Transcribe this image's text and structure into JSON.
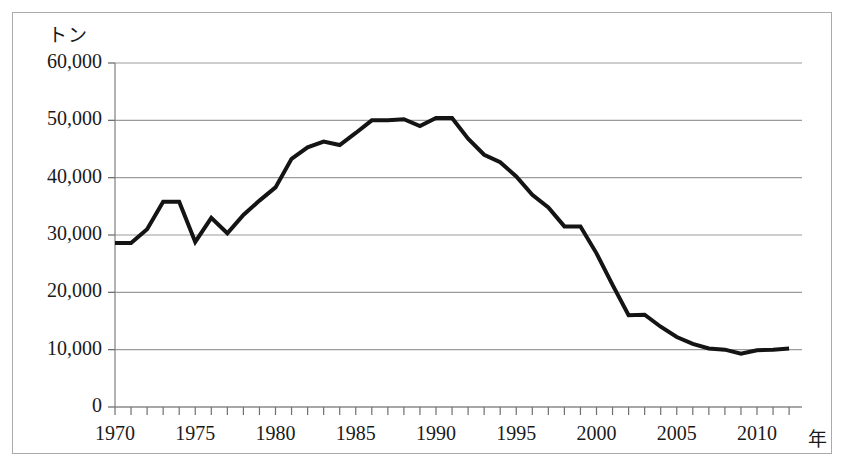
{
  "chart_data": {
    "type": "line",
    "title": "",
    "subtitle": "",
    "xlabel": "年",
    "ylabel": "トン",
    "ylim": [
      0,
      60000
    ],
    "xlim": [
      1970,
      2012
    ],
    "grid": true,
    "legend": false,
    "y_ticks": [
      {
        "value": 60000,
        "label": "60,000"
      },
      {
        "value": 50000,
        "label": "50,000"
      },
      {
        "value": 40000,
        "label": "40,000"
      },
      {
        "value": 30000,
        "label": "30,000"
      },
      {
        "value": 20000,
        "label": "20,000"
      },
      {
        "value": 10000,
        "label": "10,000"
      },
      {
        "value": 0,
        "label": "0"
      }
    ],
    "x_ticks_major": [
      {
        "value": 1970,
        "label": "1970"
      },
      {
        "value": 1975,
        "label": "1975"
      },
      {
        "value": 1980,
        "label": "1980"
      },
      {
        "value": 1985,
        "label": "1985"
      },
      {
        "value": 1990,
        "label": "1990"
      },
      {
        "value": 1995,
        "label": "1995"
      },
      {
        "value": 2000,
        "label": "2000"
      },
      {
        "value": 2005,
        "label": "2005"
      },
      {
        "value": 2010,
        "label": "2010"
      }
    ],
    "x_tick_interval_minor": 1,
    "series": [
      {
        "name": "",
        "color": "#141414",
        "line_width": 4,
        "x": [
          1970,
          1971,
          1972,
          1973,
          1974,
          1975,
          1976,
          1977,
          1978,
          1979,
          1980,
          1981,
          1982,
          1983,
          1984,
          1985,
          1986,
          1987,
          1988,
          1989,
          1990,
          1991,
          1992,
          1993,
          1994,
          1995,
          1996,
          1997,
          1998,
          1999,
          2000,
          2001,
          2002,
          2003,
          2004,
          2005,
          2006,
          2007,
          2008,
          2009,
          2010,
          2011,
          2012
        ],
        "values": [
          28600,
          28600,
          31000,
          35800,
          35800,
          28800,
          33000,
          30300,
          33500,
          36000,
          38300,
          43300,
          45300,
          46300,
          45700,
          47800,
          50000,
          50000,
          50200,
          49000,
          50400,
          50400,
          46800,
          44000,
          42700,
          40200,
          37000,
          34800,
          31500,
          31500,
          26800,
          21300,
          16000,
          16100,
          14000,
          12200,
          11000,
          10200,
          10000,
          9300,
          9900,
          10000,
          10200
        ]
      }
    ]
  },
  "axes": {
    "y_unit": "トン",
    "x_unit": "年"
  }
}
